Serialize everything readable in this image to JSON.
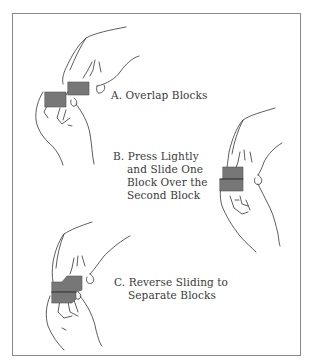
{
  "diagram": {
    "frame": {
      "border_color": "#8a8a8a",
      "background": "#ffffff"
    },
    "block_color": "#777777",
    "line_color": "#333333",
    "steps": [
      {
        "id": "A",
        "letter": "A.",
        "lines": [
          "Overlap Blocks"
        ]
      },
      {
        "id": "B",
        "letter": "B.",
        "lines": [
          "Press Lightly",
          "and Slide One",
          "Block Over the",
          "Second Block"
        ]
      },
      {
        "id": "C",
        "letter": "C.",
        "lines": [
          "Reverse Sliding to",
          "Separate Blocks"
        ]
      }
    ]
  }
}
